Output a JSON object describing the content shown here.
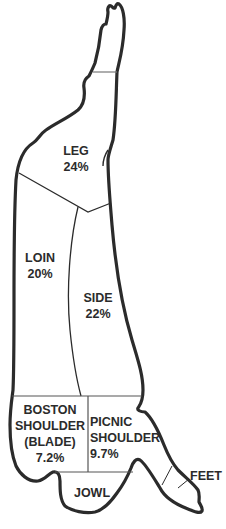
{
  "diagram": {
    "outline_color": "#2b2b2b",
    "background": "#ffffff",
    "regions": [
      {
        "name": "LEG",
        "value": "24%"
      },
      {
        "name": "LOIN",
        "value": "20%"
      },
      {
        "name": "SIDE",
        "value": "22%"
      },
      {
        "name_lines": [
          "BOSTON",
          "SHOULDER",
          "(BLADE)"
        ],
        "value": "7.2%"
      },
      {
        "name_lines": [
          "PICNIC",
          "SHOULDER"
        ],
        "value": "9.7%"
      },
      {
        "name": "JOWL"
      },
      {
        "name": "FEET"
      }
    ]
  }
}
